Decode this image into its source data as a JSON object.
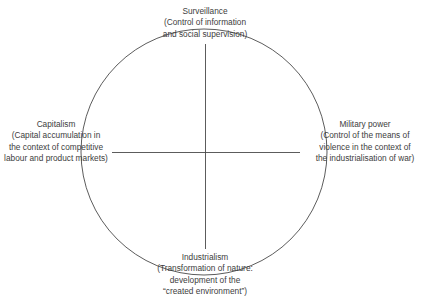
{
  "diagram": {
    "type": "circle-with-cross",
    "geometry": {
      "circle_center_x": 204,
      "circle_center_y": 152,
      "circle_radius": 123,
      "horizontal_line_x1": 112,
      "horizontal_line_x2": 300,
      "horizontal_line_y": 152,
      "vertical_line_y1": 44,
      "vertical_line_y2": 249,
      "vertical_line_x": 205
    },
    "colors": {
      "background": "#ffffff",
      "stroke": "#4a4a4a",
      "text": "#3d3d3d"
    },
    "nodes": [
      {
        "id": "surveillance",
        "position": "top",
        "title": "Surveillance",
        "description_lines": [
          "(Control of information",
          "and social supervision)"
        ]
      },
      {
        "id": "capitalism",
        "position": "left",
        "title": "Capitalism",
        "description_lines": [
          "(Capital accumulation in",
          "the context of competitive",
          "labour and product markets)"
        ]
      },
      {
        "id": "military-power",
        "position": "right",
        "title": "Military power",
        "description_lines": [
          "(Control of the means of",
          "violence in the context of",
          "the industrialisation of war)"
        ]
      },
      {
        "id": "industrialism",
        "position": "bottom",
        "title": "Industrialism",
        "description_lines": [
          "(Transformation of nature:",
          "development of the",
          "“created environment”)"
        ]
      }
    ]
  }
}
